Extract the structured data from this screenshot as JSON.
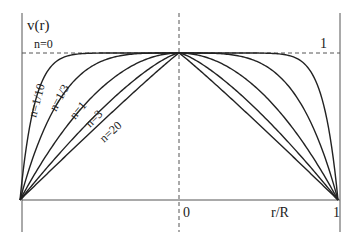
{
  "chart_data": {
    "type": "line",
    "title": "",
    "xlabel": "r/R",
    "ylabel": "v(r)",
    "x_ticks": [
      "0",
      "1"
    ],
    "y_ticks": [
      "1"
    ],
    "xlim": [
      -1,
      1
    ],
    "ylim": [
      0,
      1
    ],
    "grid": false,
    "legend": "inline labels on curves",
    "formula": "v = 1 - |r/R|^((n+1)/n)",
    "series": [
      {
        "name": "n=0",
        "exponent": "inf",
        "label": "n=0"
      },
      {
        "name": "n=1/10",
        "exponent": 11,
        "label": "n=1/10"
      },
      {
        "name": "n=1/3",
        "exponent": 4,
        "label": "n=1/3"
      },
      {
        "name": "n=1",
        "exponent": 2,
        "label": "n=1"
      },
      {
        "name": "n=3",
        "exponent": 1.3333,
        "label": "n=3"
      },
      {
        "name": "n=20",
        "exponent": 1.05,
        "label": "n=20"
      }
    ]
  },
  "labels": {
    "ylabel": "v(r)",
    "xlabel": "r/R",
    "zero": "0",
    "one_x": "1",
    "one_y": "1",
    "n0": "n=0",
    "n110": "n=1/10",
    "n13": "n=1/3",
    "n1": "n=1",
    "n3": "n=3",
    "n20": "n=20"
  }
}
